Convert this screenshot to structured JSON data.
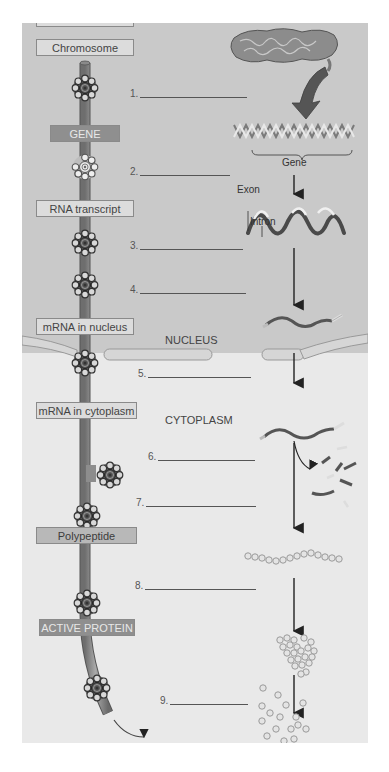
{
  "diagram": {
    "colors": {
      "nucleus_bg": "#c9c9c9",
      "cytoplasm_bg": "#e9e9e9",
      "gene_box": "#8f8f8f",
      "active_protein_box": "#8f8f8f",
      "stage_box": "#dcdcdc",
      "arrow": "#222222"
    },
    "stages": [
      {
        "label": "Chromosome",
        "style": "light"
      },
      {
        "label": "GENE",
        "style": "dark"
      },
      {
        "label": "RNA transcript",
        "style": "light"
      },
      {
        "label": "mRNA in nucleus",
        "style": "light"
      },
      {
        "label": "mRNA in cytoplasm",
        "style": "light"
      },
      {
        "label": "Polypeptide",
        "style": "mid"
      },
      {
        "label": "ACTIVE PROTEIN",
        "style": "dark"
      }
    ],
    "blanks": [
      {
        "number": "1.",
        "value": ""
      },
      {
        "number": "2.",
        "value": ""
      },
      {
        "number": "3.",
        "value": ""
      },
      {
        "number": "4.",
        "value": ""
      },
      {
        "number": "5.",
        "value": ""
      },
      {
        "number": "6.",
        "value": ""
      },
      {
        "number": "7.",
        "value": ""
      },
      {
        "number": "8.",
        "value": ""
      },
      {
        "number": "9.",
        "value": ""
      }
    ],
    "regions": {
      "nucleus": "NUCLEUS",
      "cytoplasm": "CYTOPLASM"
    },
    "annotations": {
      "gene": "Gene",
      "exon": "Exon",
      "intron": "Intron"
    }
  }
}
